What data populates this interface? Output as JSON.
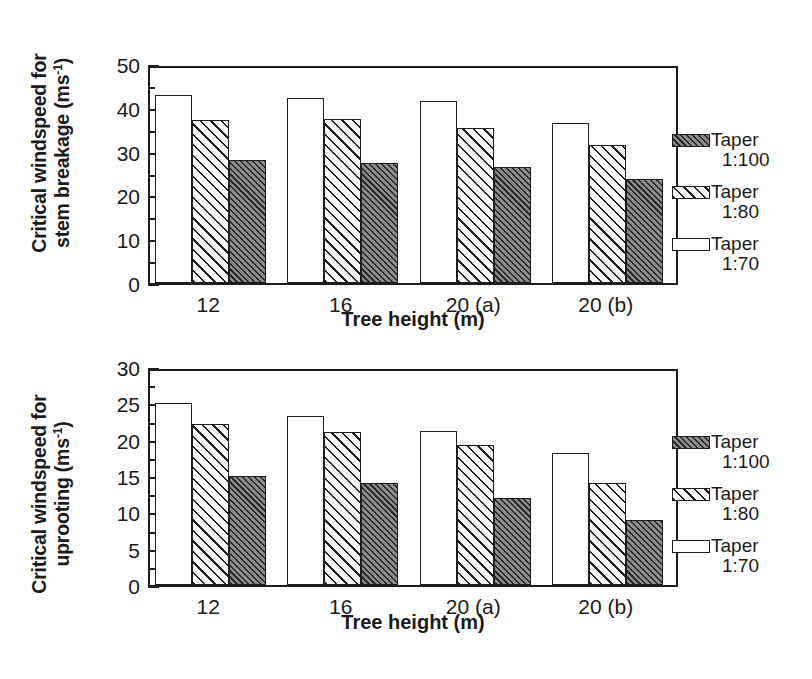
{
  "figure": {
    "panels": [
      "stem_breakage",
      "uprooting"
    ]
  },
  "legend": {
    "entries": [
      {
        "label_line1": "Taper",
        "label_line2": "1:100",
        "swatch": "dark-hatch-swatch",
        "series": "Taper 1:100"
      },
      {
        "label_line1": "Taper",
        "label_line2": "1:80",
        "swatch": "diagonal-hatch-swatch",
        "series": "Taper 1:80"
      },
      {
        "label_line1": "Taper",
        "label_line2": "1:70",
        "swatch": "white-swatch",
        "series": "Taper 1:70"
      }
    ]
  },
  "chart_data": [
    {
      "type": "bar",
      "id": "stem_breakage",
      "title": "",
      "xlabel": "Tree height (m)",
      "ylabel": "Critical windspeed for stem breakage (ms-1)",
      "ylabel_line1": "Critical windspeed for",
      "ylabel_line2": "stem breakage (ms",
      "ylabel_line2_sup": "-1",
      "ylabel_line2_end": ")",
      "categories": [
        "12",
        "16",
        "20 (a)",
        "20 (b)"
      ],
      "ylim": [
        0,
        50
      ],
      "yticks": [
        0,
        10,
        20,
        30,
        40,
        50
      ],
      "yticks_minor_step": 5,
      "grid": false,
      "legend_position": "right",
      "series": [
        {
          "name": "Taper 1:70",
          "style": "white",
          "values": [
            43.0,
            42.2,
            41.5,
            36.5
          ]
        },
        {
          "name": "Taper 1:80",
          "style": "hatch",
          "values": [
            37.2,
            37.4,
            35.3,
            31.5
          ]
        },
        {
          "name": "Taper 1:100",
          "style": "dark",
          "values": [
            28.0,
            27.3,
            26.4,
            23.7
          ]
        }
      ]
    },
    {
      "type": "bar",
      "id": "uprooting",
      "title": "",
      "xlabel": "Tree height (m)",
      "ylabel": "Critical windspeed for uprooting (ms-1)",
      "ylabel_line1": "Critical windspeed for",
      "ylabel_line2": "uprooting (ms",
      "ylabel_line2_sup": "-1",
      "ylabel_line2_end": ")",
      "categories": [
        "12",
        "16",
        "20 (a)",
        "20 (b)"
      ],
      "ylim": [
        0,
        30
      ],
      "yticks": [
        0,
        5,
        10,
        15,
        20,
        25,
        30
      ],
      "yticks_minor_step": 2.5,
      "grid": false,
      "legend_position": "right",
      "series": [
        {
          "name": "Taper 1:70",
          "style": "white",
          "values": [
            25.1,
            23.2,
            21.2,
            18.1
          ]
        },
        {
          "name": "Taper 1:80",
          "style": "hatch",
          "values": [
            22.1,
            21.1,
            19.2,
            14.1
          ]
        },
        {
          "name": "Taper 1:100",
          "style": "dark",
          "values": [
            15.0,
            14.1,
            12.0,
            9.0
          ]
        }
      ]
    }
  ]
}
